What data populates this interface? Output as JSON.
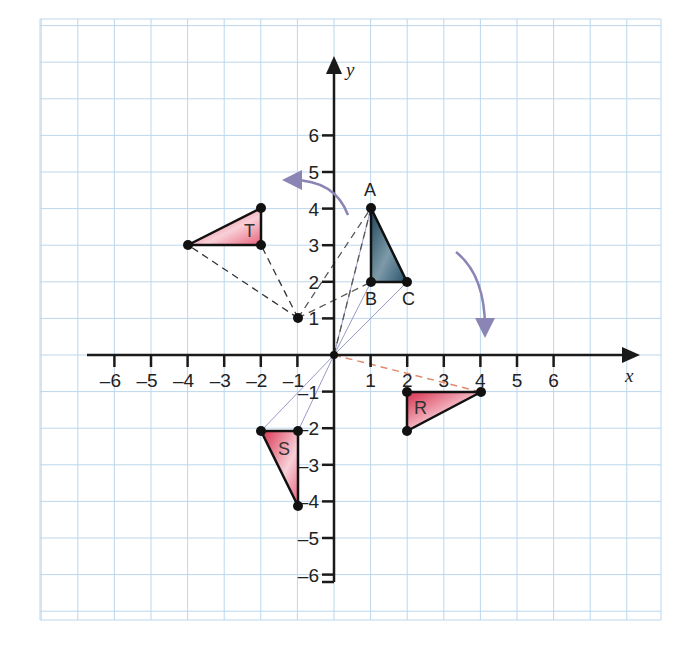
{
  "diagram": {
    "type": "coordinate-plane-rotation",
    "axes": {
      "x_label": "x",
      "y_label": "y",
      "x_ticks": [
        "-6",
        "-5",
        "-4",
        "-3",
        "-2",
        "-1",
        "1",
        "2",
        "3",
        "4",
        "5",
        "6"
      ],
      "y_ticks": [
        "6",
        "5",
        "4",
        "3",
        "2",
        "1",
        "-1",
        "-2",
        "-3",
        "-4",
        "-5",
        "-6"
      ],
      "x_range": [
        -6,
        6
      ],
      "y_range": [
        -6,
        6
      ]
    },
    "origin_point": [
      0,
      0
    ],
    "centre_point": [
      -1,
      1
    ],
    "shapes": [
      {
        "name": "ABC",
        "label": "",
        "vertices": [
          [
            1,
            4
          ],
          [
            1,
            2
          ],
          [
            2,
            2
          ]
        ],
        "vertex_labels": [
          "A",
          "B",
          "C"
        ],
        "fill": "#2f5a6e"
      },
      {
        "name": "T",
        "label": "T",
        "vertices": [
          [
            -4,
            3
          ],
          [
            -2,
            4
          ],
          [
            -2,
            3
          ]
        ],
        "fill": "#e0405a"
      },
      {
        "name": "R",
        "label": "R",
        "vertices": [
          [
            2,
            -1
          ],
          [
            4,
            -1
          ],
          [
            2,
            -2
          ]
        ],
        "fill": "#e0405a"
      },
      {
        "name": "S",
        "label": "S",
        "vertices": [
          [
            -2,
            -2
          ],
          [
            -1,
            -2
          ],
          [
            -1,
            -4
          ]
        ],
        "fill": "#e0405a"
      }
    ],
    "colors": {
      "grid": "#bcd7ec",
      "axis": "#1a1a1a",
      "arrow": "#8a85b5",
      "dashed_dark": "#333333",
      "dashed_orange": "#e08a6a",
      "construction": "#9a9ac8",
      "shape_pink": "#e0405a",
      "shape_blue": "#2f5a6e"
    }
  }
}
